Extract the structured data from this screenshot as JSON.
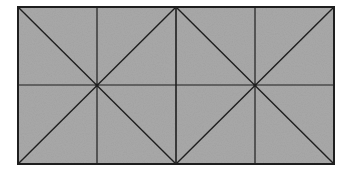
{
  "diagram": {
    "canvas": {
      "width": 348,
      "height": 175,
      "background": "#ffffff"
    },
    "rect": {
      "x1": 18,
      "y1": 7,
      "x2": 334,
      "y2": 164
    },
    "fill_color": "#a9a9a9",
    "line_color": "#1e1e1e",
    "grid": {
      "columns": 4,
      "rows": 2,
      "vertical_lines_x": [
        97,
        176,
        255
      ],
      "horizontal_line_y": 85
    },
    "star_centers": [
      {
        "x": 97,
        "y": 85
      },
      {
        "x": 255,
        "y": 85
      }
    ],
    "diagonals": [
      {
        "from": [
          18,
          7
        ],
        "to": [
          176,
          164
        ]
      },
      {
        "from": [
          176,
          7
        ],
        "to": [
          18,
          164
        ]
      },
      {
        "from": [
          176,
          7
        ],
        "to": [
          334,
          164
        ]
      },
      {
        "from": [
          334,
          7
        ],
        "to": [
          176,
          164
        ]
      }
    ]
  }
}
